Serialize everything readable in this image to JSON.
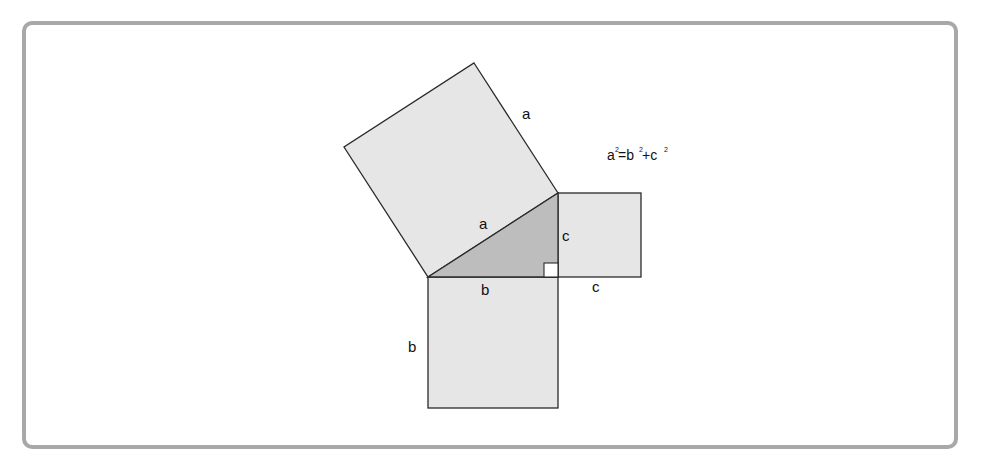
{
  "diagram": {
    "equation": {
      "text": "a²=b²+c²",
      "parts": [
        "a",
        "2",
        "=b",
        "2",
        "+c",
        "2"
      ]
    },
    "labels": {
      "hypotenuse_square_side": "a",
      "hypotenuse": "a",
      "leg_c_vertical": "c",
      "leg_b_horizontal": "b",
      "square_c_bottom": "c",
      "square_b_left": "b"
    },
    "shapes": {
      "square_a": {
        "side": "a",
        "fill": "#e6e6e6"
      },
      "square_b": {
        "side": "b",
        "fill": "#e6e6e6"
      },
      "square_c": {
        "side": "c",
        "fill": "#e6e6e6"
      },
      "triangle": {
        "fill": "#bdbdbd",
        "right_angle_marker": true
      }
    },
    "colors": {
      "stroke": "#2a2a2a",
      "frame_border": "#a8a8a8",
      "square_fill": "#e6e6e6",
      "triangle_fill": "#bdbdbd"
    }
  }
}
